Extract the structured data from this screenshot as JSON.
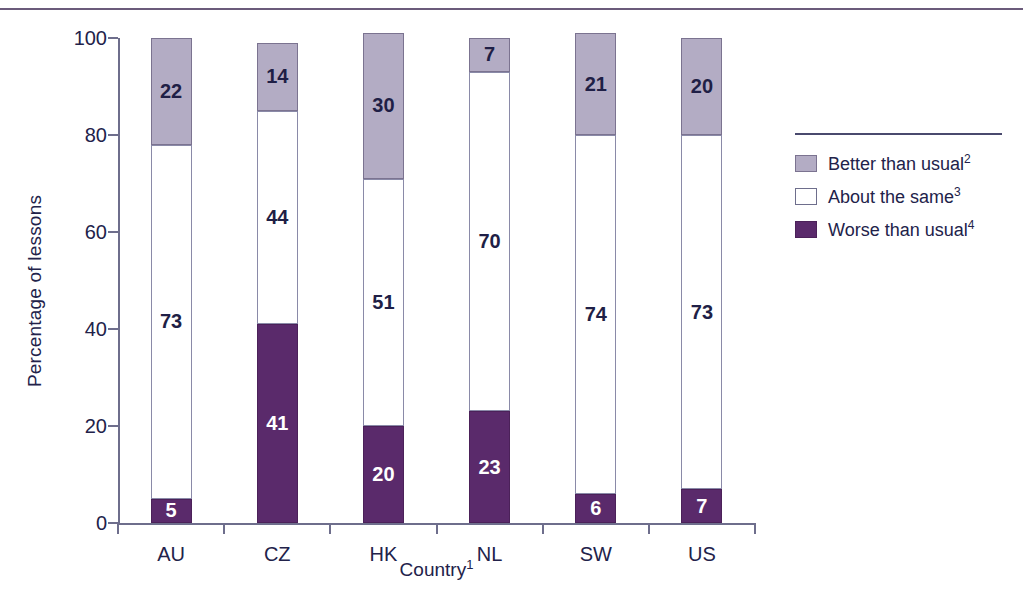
{
  "chart_data": {
    "type": "bar",
    "subtype": "stacked-100-percent",
    "title": "",
    "xlabel": "Country",
    "xlabel_footnote": "1",
    "ylabel": "Percentage of lessons",
    "ylim": [
      0,
      100
    ],
    "yticks": [
      "0",
      "20",
      "40",
      "60",
      "80",
      "100"
    ],
    "grid": false,
    "legend_position": "right",
    "categories": [
      "AU",
      "CZ",
      "HK",
      "NL",
      "SW",
      "US"
    ],
    "series": [
      {
        "name": "Worse than usual",
        "footnote": "4",
        "color": "#5a2a6b",
        "label_color": "#ffffff",
        "values": [
          5,
          41,
          20,
          23,
          6,
          7
        ]
      },
      {
        "name": "About the same",
        "footnote": "3",
        "color": "#ffffff",
        "label_color": "#1f1f46",
        "values": [
          73,
          44,
          51,
          70,
          74,
          73
        ]
      },
      {
        "name": "Better than usual",
        "footnote": "2",
        "color": "#b3acc4",
        "label_color": "#1f1f46",
        "values": [
          22,
          14,
          30,
          7,
          21,
          20
        ]
      }
    ]
  },
  "axes": {
    "y_title": "Percentage of lessons",
    "x_title": "Country",
    "x_title_sup": "1",
    "ticks_y": [
      {
        "value": 100,
        "label": "100"
      },
      {
        "value": 80,
        "label": "80"
      },
      {
        "value": 60,
        "label": "60"
      },
      {
        "value": 40,
        "label": "40"
      },
      {
        "value": 20,
        "label": "20"
      },
      {
        "value": 0,
        "label": "0"
      }
    ]
  },
  "legend": {
    "items": [
      {
        "label": "Better than usual",
        "sup": "2",
        "swatch": "legend-swatch-better"
      },
      {
        "label": "About the same",
        "sup": "3",
        "swatch": "legend-swatch-same"
      },
      {
        "label": "Worse than usual",
        "sup": "4",
        "swatch": "legend-swatch-worse"
      }
    ]
  },
  "colors": {
    "better": "#b3acc4",
    "same": "#ffffff",
    "worse": "#5a2a6b",
    "axis": "#6e6e8c",
    "rule": "#6b5b7b",
    "text": "#22224a"
  }
}
